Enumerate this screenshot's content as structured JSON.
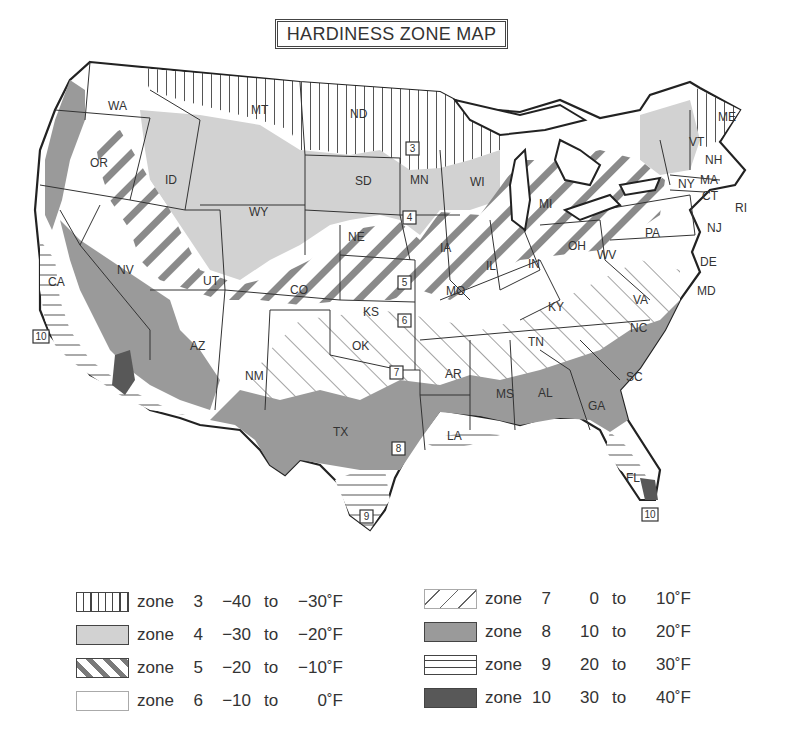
{
  "title": "HARDINESS ZONE MAP",
  "colors": {
    "zone3_pattern": "vertical-lines",
    "zone4_fill": "#d2d2d2",
    "zone5_pattern": "thick-diagonal-stripes",
    "zone6_fill": "#ffffff",
    "zone7_pattern": "thin-diagonal-lines",
    "zone8_fill": "#9a9a9a",
    "zone9_pattern": "horizontal-lines",
    "zone10_fill": "#585858",
    "outline": "#222222"
  },
  "legend": {
    "left": [
      {
        "word": "zone",
        "zone": "3",
        "from": "−40",
        "to": "to",
        "end": "−30˚F",
        "swatch": "zone3-vertical-lines"
      },
      {
        "word": "zone",
        "zone": "4",
        "from": "−30",
        "to": "to",
        "end": "−20˚F",
        "swatch": "zone4-light-gray"
      },
      {
        "word": "zone",
        "zone": "5",
        "from": "−20",
        "to": "to",
        "end": "−10˚F",
        "swatch": "zone5-thick-diagonal"
      },
      {
        "word": "zone",
        "zone": "6",
        "from": "−10",
        "to": "to",
        "end": "0˚F",
        "swatch": "zone6-white"
      }
    ],
    "right": [
      {
        "word": "zone",
        "zone": "7",
        "from": "0",
        "to": "to",
        "end": "10˚F",
        "swatch": "zone7-thin-diagonal"
      },
      {
        "word": "zone",
        "zone": "8",
        "from": "10",
        "to": "to",
        "end": "20˚F",
        "swatch": "zone8-medium-gray"
      },
      {
        "word": "zone",
        "zone": "9",
        "from": "20",
        "to": "to",
        "end": "30˚F",
        "swatch": "zone9-horizontal-lines"
      },
      {
        "word": "zone",
        "zone": "10",
        "from": "30",
        "to": "to",
        "end": "40˚F",
        "swatch": "zone10-dark-gray"
      }
    ]
  },
  "states": {
    "WA": "WA",
    "OR": "OR",
    "CA": "CA",
    "ID": "ID",
    "NV": "NV",
    "MT": "MT",
    "WY": "WY",
    "UT": "UT",
    "AZ": "AZ",
    "CO": "CO",
    "NM": "NM",
    "ND": "ND",
    "SD": "SD",
    "NE": "NE",
    "KS": "KS",
    "OK": "OK",
    "TX": "TX",
    "MN": "MN",
    "IA": "IA",
    "MO": "MO",
    "AR": "AR",
    "LA": "LA",
    "WI": "WI",
    "IL": "IL",
    "MS": "MS",
    "MI": "MI",
    "IN": "IN",
    "KY": "KY",
    "TN": "TN",
    "AL": "AL",
    "OH": "OH",
    "GA": "GA",
    "FL": "FL",
    "WV": "WV",
    "VA": "VA",
    "NC": "NC",
    "SC": "SC",
    "PA": "PA",
    "NY": "NY",
    "VT": "VT",
    "NH": "NH",
    "ME": "ME",
    "MA": "MA",
    "CT": "CT",
    "RI": "RI",
    "NJ": "NJ",
    "DE": "DE",
    "MD": "MD"
  },
  "zone_markers": {
    "m3": "3",
    "m4": "4",
    "m5": "5",
    "m6": "6",
    "m7": "7",
    "m8": "8",
    "m9": "9",
    "m10_ca": "10",
    "m10_fl": "10"
  }
}
